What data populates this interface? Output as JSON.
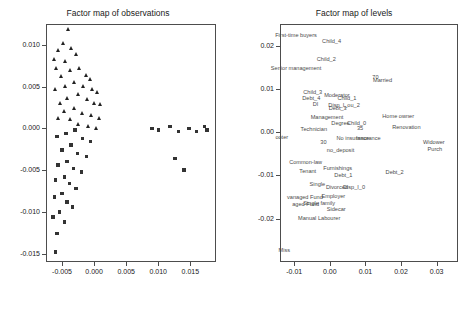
{
  "chart_data": [
    {
      "type": "scatter",
      "title": "Factor map of observations",
      "xlabel": "",
      "ylabel": "",
      "xlim": [
        -0.0075,
        0.019
      ],
      "ylim": [
        -0.016,
        0.0125
      ],
      "xticks": [
        "-0.005",
        "0.000",
        "0.005",
        "0.010",
        "0.015"
      ],
      "xtickvals": [
        -0.005,
        0.0,
        0.005,
        0.01,
        0.015
      ],
      "yticks": [
        "-0.015",
        "-0.010",
        "-0.005",
        "0.000",
        "0.005",
        "0.010"
      ],
      "ytickvals": [
        -0.015,
        -0.01,
        -0.005,
        0.0,
        0.005,
        0.01
      ],
      "grid": false,
      "legend": "none",
      "series": [
        {
          "name": "group-triangle",
          "marker": "triangle",
          "points": [
            [
              -0.004,
              0.0118
            ],
            [
              -0.0047,
              0.0102
            ],
            [
              -0.0055,
              0.0093
            ],
            [
              -0.0035,
              0.0095
            ],
            [
              -0.0062,
              0.0082
            ],
            [
              -0.0044,
              0.008
            ],
            [
              -0.0028,
              0.0088
            ],
            [
              -0.0058,
              0.0071
            ],
            [
              -0.0036,
              0.0069
            ],
            [
              -0.005,
              0.0062
            ],
            [
              -0.0022,
              0.0072
            ],
            [
              -0.0012,
              0.0063
            ],
            [
              -0.0005,
              0.0058
            ],
            [
              -0.003,
              0.0055
            ],
            [
              -0.0044,
              0.005
            ],
            [
              -0.006,
              0.0046
            ],
            [
              -0.0016,
              0.005
            ],
            [
              -0.0002,
              0.0046
            ],
            [
              0.0006,
              0.0043
            ],
            [
              -0.0024,
              0.004
            ],
            [
              -0.0042,
              0.0036
            ],
            [
              -0.0052,
              0.003
            ],
            [
              -0.001,
              0.0034
            ],
            [
              0.0,
              0.003
            ],
            [
              0.001,
              0.0028
            ],
            [
              -0.003,
              0.0024
            ],
            [
              -0.0046,
              0.002
            ],
            [
              -0.0018,
              0.0018
            ],
            [
              -0.0004,
              0.0015
            ],
            [
              0.0008,
              0.0012
            ],
            [
              -0.0036,
              0.001
            ],
            [
              -0.0056,
              0.0012
            ],
            [
              -0.0024,
              0.0004
            ],
            [
              -0.0008,
              0.0002
            ],
            [
              0.0004,
              0.0
            ]
          ]
        },
        {
          "name": "group-square",
          "marker": "square",
          "points": [
            [
              -0.003,
              -0.0002
            ],
            [
              -0.0044,
              -0.0006
            ],
            [
              -0.0058,
              -0.001
            ],
            [
              -0.0018,
              -0.0012
            ],
            [
              -0.0006,
              -0.0016
            ],
            [
              -0.0036,
              -0.002
            ],
            [
              -0.005,
              -0.0026
            ],
            [
              -0.0026,
              -0.003
            ],
            [
              -0.0012,
              -0.0034
            ],
            [
              -0.0042,
              -0.004
            ],
            [
              -0.0056,
              -0.0044
            ],
            [
              -0.0032,
              -0.0048
            ],
            [
              -0.002,
              -0.0052
            ],
            [
              -0.0046,
              -0.0058
            ],
            [
              -0.006,
              -0.0062
            ],
            [
              -0.0038,
              -0.0066
            ],
            [
              -0.0028,
              -0.0072
            ],
            [
              -0.005,
              -0.0078
            ],
            [
              -0.0062,
              -0.0082
            ],
            [
              -0.0042,
              -0.0088
            ],
            [
              -0.0034,
              -0.0094
            ],
            [
              -0.0054,
              -0.01
            ],
            [
              -0.0064,
              -0.0106
            ],
            [
              -0.0046,
              -0.0112
            ],
            [
              -0.0058,
              -0.0126
            ],
            [
              -0.006,
              -0.0148
            ],
            [
              0.009,
              0.0
            ],
            [
              0.01,
              -0.0002
            ],
            [
              0.0118,
              0.0002
            ],
            [
              0.0132,
              -0.0004
            ],
            [
              0.0148,
              0.0
            ],
            [
              0.016,
              -0.0004
            ],
            [
              0.0172,
              0.0002
            ],
            [
              0.0176,
              -0.0002
            ],
            [
              0.014,
              -0.005
            ],
            [
              0.0126,
              -0.0036
            ]
          ]
        }
      ]
    },
    {
      "type": "scatter",
      "title": "Factor map of levels",
      "xlabel": "",
      "ylabel": "",
      "xlim": [
        -0.014,
        0.036
      ],
      "ylim": [
        -0.03,
        0.025
      ],
      "xticks": [
        "-0.01",
        "0.00",
        "0.01",
        "0.02",
        "0.03"
      ],
      "xtickvals": [
        -0.01,
        0.0,
        0.01,
        0.02,
        0.03
      ],
      "yticks": [
        "-0.02",
        "-0.01",
        "0.00",
        "0.01",
        "0.02"
      ],
      "ytickvals": [
        -0.02,
        -0.01,
        0.0,
        0.01,
        0.02
      ],
      "grid": false,
      "legend": "none",
      "labels": [
        {
          "text": "First-time buyers",
          "x": -0.0095,
          "y": 0.0224
        },
        {
          "text": "Child_4",
          "x": 0.0005,
          "y": 0.021
        },
        {
          "text": "Child_2",
          "x": -0.001,
          "y": 0.0168
        },
        {
          "text": "Senior management",
          "x": -0.0095,
          "y": 0.0148
        },
        {
          "text": "70",
          "x": 0.0128,
          "y": 0.0128
        },
        {
          "text": "Married",
          "x": 0.0148,
          "y": 0.012
        },
        {
          "text": "Child_3",
          "x": -0.0048,
          "y": 0.0092
        },
        {
          "text": "Moderator",
          "x": 0.002,
          "y": 0.0085
        },
        {
          "text": "Debt_4",
          "x": -0.0052,
          "y": 0.0078
        },
        {
          "text": "Child_1",
          "x": 0.0048,
          "y": 0.0078
        },
        {
          "text": "DI",
          "x": -0.004,
          "y": 0.0066
        },
        {
          "text": "Disp_I_ou_2",
          "x": 0.004,
          "y": 0.0062
        },
        {
          "text": "Debt_3",
          "x": 0.0022,
          "y": 0.0056
        },
        {
          "text": "Management",
          "x": -0.0008,
          "y": 0.0036
        },
        {
          "text": "Home owner",
          "x": 0.0192,
          "y": 0.0038
        },
        {
          "text": "Degree",
          "x": 0.003,
          "y": 0.0022
        },
        {
          "text": "Child_0",
          "x": 0.0075,
          "y": 0.0022
        },
        {
          "text": "Renovation",
          "x": 0.0215,
          "y": 0.0012
        },
        {
          "text": "Technician",
          "x": -0.0045,
          "y": 0.0008
        },
        {
          "text": "35",
          "x": 0.0085,
          "y": 0.001
        },
        {
          "text": "ooter",
          "x": -0.0135,
          "y": -0.001
        },
        {
          "text": "30",
          "x": -0.0018,
          "y": -0.0022
        },
        {
          "text": "No insurance",
          "x": 0.0065,
          "y": -0.0014
        },
        {
          "text": "Insurance",
          "x": 0.0108,
          "y": -0.0014
        },
        {
          "text": "Widower",
          "x": 0.0292,
          "y": -0.0022
        },
        {
          "text": "no_deposit",
          "x": 0.003,
          "y": -0.0042
        },
        {
          "text": "Purch",
          "x": 0.0295,
          "y": -0.004
        },
        {
          "text": "Common-law",
          "x": -0.0068,
          "y": -0.007
        },
        {
          "text": "Furnishings",
          "x": 0.0022,
          "y": -0.0082
        },
        {
          "text": "Tenant",
          "x": -0.0062,
          "y": -0.009
        },
        {
          "text": "Debt_2",
          "x": 0.0182,
          "y": -0.0092
        },
        {
          "text": "Debt_1",
          "x": 0.0038,
          "y": -0.0098
        },
        {
          "text": "Single",
          "x": -0.0035,
          "y": -0.012
        },
        {
          "text": "Divorced",
          "x": 0.002,
          "y": -0.0126
        },
        {
          "text": "Disp_I_0",
          "x": 0.0068,
          "y": -0.0126
        },
        {
          "text": "Employer",
          "x": 0.001,
          "y": -0.0148
        },
        {
          "text": "vanaged Fund",
          "x": -0.007,
          "y": -0.015
        },
        {
          "text": "aged Fund",
          "x": -0.0068,
          "y": -0.0166
        },
        {
          "text": "Single family",
          "x": -0.003,
          "y": -0.0164
        },
        {
          "text": "Sidecar",
          "x": 0.0018,
          "y": -0.0178
        },
        {
          "text": "Manual Labourer",
          "x": -0.003,
          "y": -0.0198
        },
        {
          "text": "Miss",
          "x": -0.0128,
          "y": -0.0272
        }
      ]
    }
  ],
  "left": {
    "title": "Factor map of observations"
  },
  "right": {
    "title": "Factor map of levels"
  }
}
